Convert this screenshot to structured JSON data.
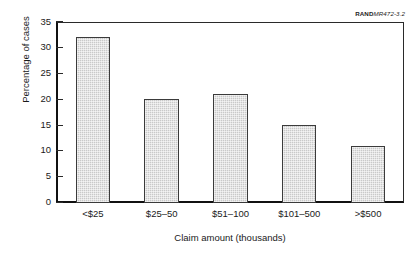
{
  "corner_tag": {
    "brand": "RAND",
    "document_id": "MR472-3.2"
  },
  "chart_data": {
    "type": "bar",
    "title": "",
    "categories": [
      "<$25",
      "$25–50",
      "$51–100",
      "$101–500",
      ">$500"
    ],
    "values": [
      32,
      20,
      21,
      15,
      11
    ],
    "xlabel": "Claim amount (thousands)",
    "ylabel": "Percentage of cases",
    "ylim": [
      0,
      35
    ],
    "ytick_values": [
      0,
      5,
      10,
      15,
      20,
      25,
      30,
      35
    ],
    "ytick_labels": [
      "0",
      "5",
      "10",
      "15",
      "20",
      "25",
      "30",
      "35"
    ],
    "grid": false,
    "legend": null,
    "bar_fill_color": "#c9c9c9",
    "bar_border_color": "#3b3b3b",
    "axis_color": "#111111",
    "background_color": "#ffffff"
  }
}
